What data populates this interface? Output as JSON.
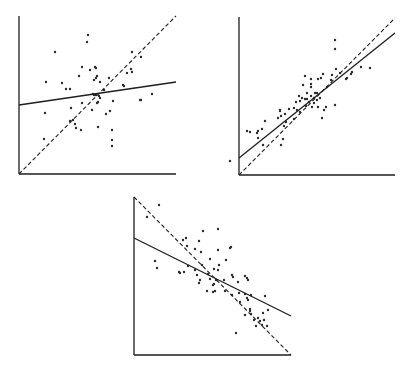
{
  "chart_data": [
    {
      "type": "scatter",
      "title": "",
      "xlabel": "",
      "ylabel": "",
      "grid": false,
      "legend": null,
      "panel": "top-left",
      "axes": {
        "origin": [
          19,
          174
        ],
        "x_end": 176,
        "y_end": 16
      },
      "lines": {
        "dashed": {
          "from": [
            19,
            174
          ],
          "to": [
            176,
            16
          ],
          "description": "identity / 45-degree line"
        },
        "solid": {
          "from": [
            19,
            105
          ],
          "to": [
            176,
            82
          ],
          "description": "fitted regression line (shallow slope)"
        }
      },
      "points": [
        [
          88,
          35
        ],
        [
          87,
          42
        ],
        [
          55,
          52
        ],
        [
          132,
          52
        ],
        [
          141,
          57
        ],
        [
          82,
          67
        ],
        [
          90,
          70
        ],
        [
          96,
          68
        ],
        [
          95,
          67
        ],
        [
          79,
          76
        ],
        [
          97,
          76
        ],
        [
          96,
          78
        ],
        [
          94,
          80
        ],
        [
          100,
          82
        ],
        [
          109,
          78
        ],
        [
          127,
          73
        ],
        [
          131,
          69
        ],
        [
          132,
          72
        ],
        [
          46,
          82
        ],
        [
          62,
          83
        ],
        [
          66,
          89
        ],
        [
          70,
          89
        ],
        [
          124,
          86
        ],
        [
          123,
          85
        ],
        [
          94,
          95
        ],
        [
          93,
          94
        ],
        [
          99,
          96
        ],
        [
          100,
          98
        ],
        [
          113,
          101
        ],
        [
          152,
          94
        ],
        [
          141,
          100
        ],
        [
          140,
          100
        ],
        [
          82,
          103
        ],
        [
          97,
          103
        ],
        [
          98,
          102
        ],
        [
          71,
          108
        ],
        [
          45,
          113
        ],
        [
          92,
          110
        ],
        [
          110,
          111
        ],
        [
          106,
          114
        ],
        [
          73,
          120
        ],
        [
          70,
          121
        ],
        [
          75,
          124
        ],
        [
          76,
          128
        ],
        [
          81,
          130
        ],
        [
          98,
          127
        ],
        [
          112,
          130
        ],
        [
          112,
          140
        ],
        [
          112,
          146
        ],
        [
          44,
          139
        ],
        [
          96,
          95
        ],
        [
          104,
          90
        ]
      ]
    },
    {
      "type": "scatter",
      "title": "",
      "xlabel": "",
      "ylabel": "",
      "grid": false,
      "legend": null,
      "panel": "top-right",
      "axes": {
        "origin": [
          239,
          175
        ],
        "x_end": 395,
        "y_end": 17
      },
      "lines": {
        "dashed": {
          "from": [
            239,
            175
          ],
          "to": [
            395,
            18
          ],
          "description": "identity / 45-degree line"
        },
        "solid": {
          "from": [
            239,
            158
          ],
          "to": [
            395,
            33
          ],
          "description": "fitted regression line (close to identity)"
        }
      },
      "points": [
        [
          335,
          40
        ],
        [
          335,
          49
        ],
        [
          305,
          76
        ],
        [
          323,
          74
        ],
        [
          332,
          75
        ],
        [
          321,
          78
        ],
        [
          318,
          79
        ],
        [
          311,
          79
        ],
        [
          336,
          69
        ],
        [
          340,
          73
        ],
        [
          347,
          78
        ],
        [
          352,
          72
        ],
        [
          351,
          74
        ],
        [
          346,
          79
        ],
        [
          370,
          68
        ],
        [
          361,
          67
        ],
        [
          311,
          84
        ],
        [
          311,
          87
        ],
        [
          303,
          85
        ],
        [
          327,
          87
        ],
        [
          331,
          80
        ],
        [
          317,
          93
        ],
        [
          307,
          93
        ],
        [
          314,
          98
        ],
        [
          309,
          102
        ],
        [
          314,
          103
        ],
        [
          317,
          100
        ],
        [
          320,
          98
        ],
        [
          311,
          96
        ],
        [
          307,
          99
        ],
        [
          315,
          93
        ],
        [
          302,
          98
        ],
        [
          305,
          99
        ],
        [
          312,
          107
        ],
        [
          296,
          102
        ],
        [
          289,
          109
        ],
        [
          297,
          110
        ],
        [
          324,
          110
        ],
        [
          299,
          96
        ],
        [
          300,
          101
        ],
        [
          306,
          106
        ],
        [
          318,
          107
        ],
        [
          326,
          107
        ],
        [
          335,
          105
        ],
        [
          300,
          112
        ],
        [
          294,
          108
        ],
        [
          280,
          111
        ],
        [
          280,
          110
        ],
        [
          285,
          114
        ],
        [
          294,
          119
        ],
        [
          322,
          118
        ],
        [
          284,
          126
        ],
        [
          278,
          118
        ],
        [
          281,
          116
        ],
        [
          265,
          121
        ],
        [
          286,
          122
        ],
        [
          262,
          129
        ],
        [
          258,
          131
        ],
        [
          257,
          133
        ],
        [
          283,
          139
        ],
        [
          281,
          145
        ],
        [
          258,
          138
        ],
        [
          250,
          132
        ],
        [
          263,
          145
        ],
        [
          230,
          161
        ],
        [
          247,
          131
        ]
      ]
    },
    {
      "type": "scatter",
      "title": "",
      "xlabel": "",
      "ylabel": "",
      "grid": false,
      "legend": null,
      "panel": "bottom-center",
      "axes": {
        "origin": [
          134,
          355
        ],
        "x_end": 291,
        "y_end": 197
      },
      "lines": {
        "dashed": {
          "from": [
            134,
            197
          ],
          "to": [
            291,
            355
          ],
          "description": "negative identity line"
        },
        "solid": {
          "from": [
            134,
            238
          ],
          "to": [
            291,
            316
          ],
          "description": "fitted regression line (shallower negative slope)"
        }
      },
      "points": [
        [
          147,
          217
        ],
        [
          159,
          205
        ],
        [
          203,
          231
        ],
        [
          186,
          238
        ],
        [
          187,
          246
        ],
        [
          218,
          229
        ],
        [
          201,
          252
        ],
        [
          231,
          247
        ],
        [
          218,
          250
        ],
        [
          230,
          248
        ],
        [
          183,
          240
        ],
        [
          199,
          241
        ],
        [
          195,
          249
        ],
        [
          210,
          259
        ],
        [
          219,
          265
        ],
        [
          226,
          260
        ],
        [
          218,
          270
        ],
        [
          155,
          261
        ],
        [
          157,
          268
        ],
        [
          179,
          272
        ],
        [
          180,
          273
        ],
        [
          184,
          272
        ],
        [
          188,
          266
        ],
        [
          195,
          270
        ],
        [
          208,
          274
        ],
        [
          202,
          265
        ],
        [
          214,
          269
        ],
        [
          197,
          275
        ],
        [
          200,
          280
        ],
        [
          199,
          283
        ],
        [
          210,
          279
        ],
        [
          216,
          280
        ],
        [
          224,
          280
        ],
        [
          233,
          277
        ],
        [
          232,
          275
        ],
        [
          214,
          284
        ],
        [
          207,
          291
        ],
        [
          213,
          285
        ],
        [
          213,
          292
        ],
        [
          215,
          291
        ],
        [
          238,
          282
        ],
        [
          247,
          278
        ],
        [
          245,
          276
        ],
        [
          248,
          280
        ],
        [
          239,
          293
        ],
        [
          245,
          294
        ],
        [
          225,
          291
        ],
        [
          247,
          298
        ],
        [
          251,
          295
        ],
        [
          232,
          295
        ],
        [
          240,
          302
        ],
        [
          250,
          309
        ],
        [
          250,
          311
        ],
        [
          245,
          315
        ],
        [
          251,
          314
        ],
        [
          263,
          313
        ],
        [
          258,
          318
        ],
        [
          264,
          320
        ],
        [
          260,
          321
        ],
        [
          254,
          320
        ],
        [
          262,
          325
        ],
        [
          256,
          326
        ],
        [
          236,
          333
        ],
        [
          267,
          326
        ],
        [
          268,
          310
        ],
        [
          265,
          296
        ],
        [
          248,
          300
        ]
      ]
    }
  ]
}
